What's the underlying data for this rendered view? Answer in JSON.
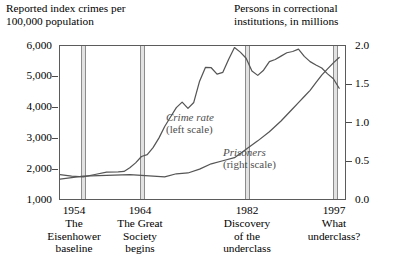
{
  "header": {
    "left_title": "Reported index crimes per\n100,000 population",
    "right_title": "Persons in correctional\ninstitutions, in millions"
  },
  "axes": {
    "left_ticks": [
      "6,000",
      "5,000",
      "4,000",
      "3,000",
      "2,000",
      "1,000"
    ],
    "right_ticks": [
      "2.0",
      "1.5",
      "1.0",
      "0.5",
      "0.0"
    ]
  },
  "series_labels": {
    "crime_name": "Crime rate",
    "crime_scale": "(left scale)",
    "prisoners_name": "Prisoners",
    "prisoners_scale": "(right scale)"
  },
  "markers": [
    {
      "year": "1954",
      "caption": "The\nEisenhower\nbaseline"
    },
    {
      "year": "1964",
      "caption": "The Great\nSociety\nbegins"
    },
    {
      "year": "1982",
      "caption": "Discovery\nof the\nunderclass"
    },
    {
      "year": "1997",
      "caption": "What\nunderclass?"
    }
  ],
  "colors": {
    "line": "#555555",
    "band_fill": "#e2e2e2",
    "band_edge": "#8c8c8c",
    "frame": "#5b5b5b",
    "series_label": "#4f4f4f",
    "text": "#000000",
    "background": "#ffffff"
  },
  "chart_data": {
    "type": "line",
    "title": "",
    "xlabel": "",
    "ylabel": "Reported index crimes per 100,000 population",
    "y2label": "Persons in correctional institutions, in millions",
    "xlim": [
      1950,
      1999
    ],
    "ylim": [
      1000,
      6000
    ],
    "y2lim": [
      0.0,
      2.0
    ],
    "grid": false,
    "legend": "inline-annotations",
    "marker_years": [
      1954,
      1964,
      1982,
      1997
    ],
    "series": [
      {
        "name": "Crime rate",
        "axis": "left",
        "unit": "reported index crimes per 100,000 population",
        "x": [
          1950,
          1952,
          1954,
          1956,
          1958,
          1960,
          1961,
          1962,
          1963,
          1964,
          1965,
          1966,
          1967,
          1968,
          1969,
          1970,
          1971,
          1972,
          1973,
          1974,
          1975,
          1976,
          1977,
          1978,
          1979,
          1980,
          1981,
          1982,
          1983,
          1984,
          1985,
          1986,
          1987,
          1988,
          1989,
          1990,
          1991,
          1992,
          1993,
          1994,
          1995,
          1996,
          1997,
          1998
        ],
        "values": [
          1800,
          1750,
          1720,
          1800,
          1880,
          1890,
          1900,
          2020,
          2180,
          2390,
          2450,
          2680,
          2990,
          3370,
          3680,
          3985,
          4165,
          3961,
          4155,
          4850,
          5300,
          5290,
          5080,
          5140,
          5565,
          5950,
          5800,
          5600,
          5180,
          5040,
          5210,
          5490,
          5560,
          5670,
          5780,
          5820,
          5900,
          5660,
          5490,
          5380,
          5280,
          5090,
          4930,
          4620
        ]
      },
      {
        "name": "Prisoners",
        "axis": "right",
        "unit": "millions of persons in correctional institutions",
        "x": [
          1950,
          1954,
          1958,
          1962,
          1964,
          1966,
          1968,
          1970,
          1972,
          1974,
          1976,
          1978,
          1980,
          1982,
          1984,
          1986,
          1988,
          1990,
          1991,
          1992,
          1993,
          1994,
          1995,
          1996,
          1997,
          1998
        ],
        "values": [
          0.26,
          0.3,
          0.31,
          0.32,
          0.31,
          0.3,
          0.29,
          0.33,
          0.34,
          0.39,
          0.46,
          0.5,
          0.54,
          0.65,
          0.76,
          0.88,
          1.02,
          1.18,
          1.26,
          1.34,
          1.42,
          1.52,
          1.62,
          1.7,
          1.78,
          1.85
        ]
      }
    ],
    "annotations": [
      {
        "text": "Crime rate (left scale)",
        "at_x": 1974,
        "at_y": 3400
      },
      {
        "text": "Prisoners (right scale)",
        "at_x": 1986,
        "at_y": 0.55
      }
    ]
  }
}
